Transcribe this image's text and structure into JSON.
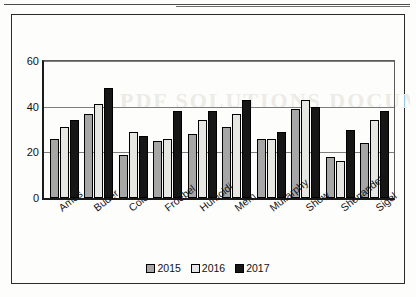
{
  "page": {
    "background_color": "#fdfdfc",
    "watermark_text": "PDF SOLUTIONS DOCUMENT"
  },
  "chart_data": {
    "type": "bar",
    "title": "",
    "subtitle": "",
    "xlabel": "",
    "ylabel": "",
    "ylim": [
      0,
      60
    ],
    "yticks": [
      0,
      20,
      40,
      60
    ],
    "gridlines": [
      20,
      40,
      60
    ],
    "grid": true,
    "legend_position": "bottom",
    "categories": [
      "Ames",
      "Buder",
      "Colo",
      "Froebel",
      "Humoldi",
      "Mem",
      "Mullarphy",
      "Show",
      "Shenandeh",
      "Sigel"
    ],
    "series": [
      {
        "name": "2015",
        "color": "#a6a6a6",
        "values": [
          26,
          37,
          19,
          25,
          28,
          31,
          26,
          39,
          18,
          24
        ]
      },
      {
        "name": "2016",
        "color": "#e6e6e3",
        "values": [
          31,
          41,
          29,
          26,
          34,
          37,
          26,
          43,
          16,
          34
        ]
      },
      {
        "name": "2017",
        "color": "#161616",
        "values": [
          34,
          48,
          27,
          38,
          38,
          43,
          29,
          40,
          30,
          38
        ]
      }
    ]
  },
  "legend": {
    "items": [
      {
        "label": "2015",
        "color": "#a6a6a6"
      },
      {
        "label": "2016",
        "color": "#e6e6e3"
      },
      {
        "label": "2017",
        "color": "#161616"
      }
    ]
  }
}
